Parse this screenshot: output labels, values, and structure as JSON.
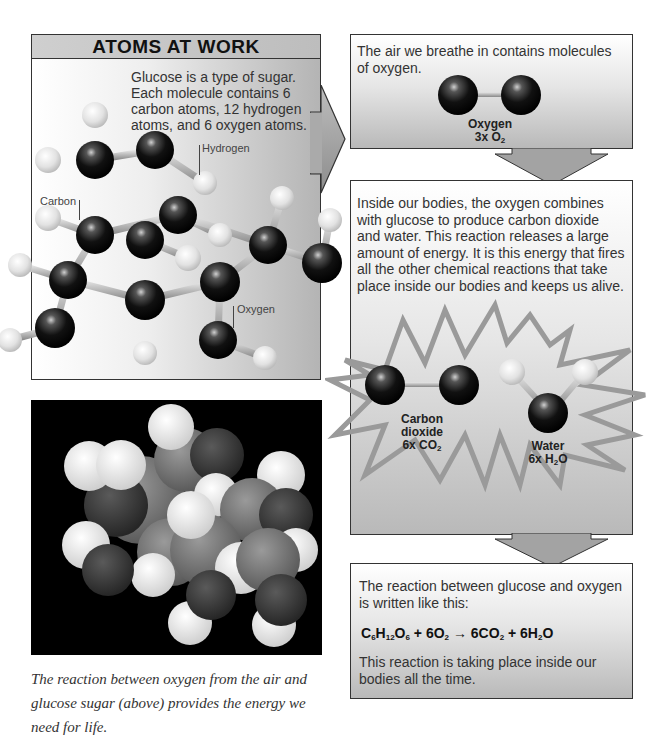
{
  "left_panel": {
    "title": "ATOMS AT WORK",
    "intro": "Glucose is a type of sugar. Each molecule contains 6 carbon atoms, 12 hydrogen atoms, and 6 oxygen atoms.",
    "labels": {
      "hydrogen": "Hydrogen",
      "carbon": "Carbon",
      "oxygen": "Oxygen"
    }
  },
  "photo": {
    "caption": "The reaction between oxygen from the air and glucose sugar (above) provides the energy we need for life."
  },
  "oxygen_box": {
    "text": "The air we breathe in contains molecules of oxygen.",
    "molecule_name": "Oxygen",
    "molecule_count": "3x O",
    "molecule_sub": "2"
  },
  "reaction_box": {
    "text": "Inside our bodies, the oxygen combines with glucose to produce carbon dioxide and water. This reaction releases a large amount of energy. It is this energy that fires all the other chemical reactions that take place inside our bodies and keeps us alive.",
    "co2": {
      "name": "Carbon dioxide",
      "count": "6x CO",
      "sub": "2"
    },
    "water": {
      "name": "Water",
      "count_pre": "6x H",
      "sub": "2",
      "count_post": "O"
    }
  },
  "equation_box": {
    "text_before": "The reaction between glucose and oxygen is written like this:",
    "equation_parts": [
      "C",
      "6",
      "H",
      "12",
      "O",
      "6",
      " + 6O",
      "2",
      " → 6CO",
      "2",
      " + 6H",
      "2",
      "O"
    ],
    "text_after": "This reaction is taking place inside our bodies all the time."
  },
  "colors": {
    "atom_dark": "#111111",
    "atom_light": "#e8e8e8",
    "frame": "#333333",
    "burst": "#9a9a9a"
  }
}
